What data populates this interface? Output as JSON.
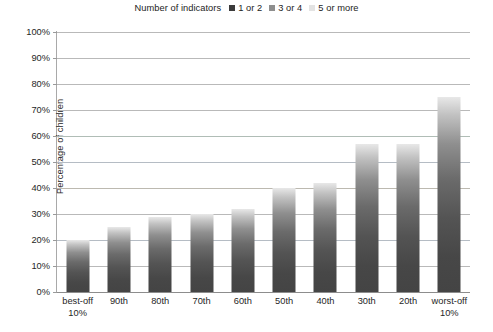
{
  "legend": {
    "title": "Number of indicators",
    "items": [
      {
        "label": "1 or 2",
        "color": "#3b3b3b"
      },
      {
        "label": "3 or 4",
        "color": "#8e8e8e"
      },
      {
        "label": "5 or more",
        "color": "#e3e3e3"
      }
    ]
  },
  "axis": {
    "y_title": "Percentage of children",
    "y_ticks": [
      "0%",
      "10%",
      "20%",
      "30%",
      "40%",
      "50%",
      "60%",
      "70%",
      "80%",
      "90%",
      "100%"
    ]
  },
  "chart_data": {
    "type": "bar",
    "title": "",
    "xlabel": "",
    "ylabel": "Percentage of children",
    "ylim": [
      0,
      100
    ],
    "grid": true,
    "legend_position": "top-center",
    "legend_title": "Number of indicators",
    "legend_entries": [
      "1 or 2",
      "3 or 4",
      "5 or more"
    ],
    "categories": [
      "best-off 10%",
      "90th",
      "80th",
      "70th",
      "60th",
      "50th",
      "40th",
      "30th",
      "20th",
      "worst-off 10%"
    ],
    "category_lines": [
      [
        "best-off",
        "10%"
      ],
      [
        "90th",
        ""
      ],
      [
        "80th",
        ""
      ],
      [
        "70th",
        ""
      ],
      [
        "60th",
        ""
      ],
      [
        "50th",
        ""
      ],
      [
        "40th",
        ""
      ],
      [
        "30th",
        ""
      ],
      [
        "20th",
        ""
      ],
      [
        "worst-off",
        "10%"
      ]
    ],
    "values": [
      20,
      25,
      29,
      30,
      32,
      40,
      42,
      57,
      57,
      75
    ],
    "value_unit": "%",
    "ytick_values": [
      0,
      10,
      20,
      30,
      40,
      50,
      60,
      70,
      80,
      90,
      100
    ]
  }
}
